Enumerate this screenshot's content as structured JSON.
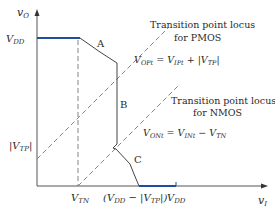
{
  "figure": {
    "type": "CMOS inverter voltage transfer characteristic",
    "axes": {
      "y_label": "v",
      "y_label_sub": "O",
      "x_label": "v",
      "x_label_sub": "I"
    },
    "y_ticks": [
      {
        "text": "V",
        "sub": "DD"
      },
      {
        "text": "|V",
        "sub": "TP",
        "suffix": "|"
      }
    ],
    "x_ticks": [
      {
        "text": "V",
        "sub": "TN"
      },
      {
        "prefix": "(V",
        "sub": "DD",
        "mid": " − |V",
        "sub2": "TP",
        "suffix": "|)"
      },
      {
        "text": "V",
        "sub": "DD"
      }
    ],
    "region_labels": [
      "A",
      "B",
      "C"
    ],
    "annotations": {
      "pmos_locus": {
        "line1": "Transition point locus",
        "line2": "for PMOS",
        "eq_lhs": "V",
        "eq_lhs_sub": "OPt",
        "eq_mid": " = V",
        "eq_mid_sub": "IPt",
        "eq_rhs": " + |V",
        "eq_rhs_sub": "TP",
        "eq_end": "|"
      },
      "nmos_locus": {
        "line1": "Transition point locus",
        "line2": "for NMOS",
        "eq_lhs": "V",
        "eq_lhs_sub": "ONt",
        "eq_mid": " = V",
        "eq_mid_sub": "INt",
        "eq_rhs": " − V",
        "eq_rhs_sub": "TN"
      }
    },
    "colors": {
      "axis": "#555555",
      "curve": "#444444",
      "highlight": "#1f4e9c",
      "dashed": "#777777"
    }
  }
}
